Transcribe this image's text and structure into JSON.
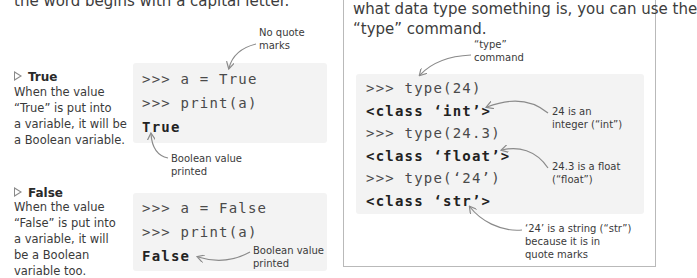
{
  "left": {
    "intro_partial": "the word begins with a capital letter.",
    "true_section": {
      "title": "True",
      "description": [
        "When the value",
        "“True” is put into",
        "a variable, it will be",
        "a Boolean variable."
      ],
      "code": [
        {
          "kind": "input",
          "text": ">>> a = True"
        },
        {
          "kind": "input",
          "text": ">>> print(a)"
        },
        {
          "kind": "output",
          "text": "True"
        }
      ],
      "note_top": [
        "No quote",
        "marks"
      ],
      "note_bottom": [
        "Boolean value",
        "printed"
      ]
    },
    "false_section": {
      "title": "False",
      "description": [
        "When the value",
        "“False” is put into",
        "a variable, it will",
        "be a Boolean",
        "variable too."
      ],
      "code": [
        {
          "kind": "input",
          "text": ">>> a = False"
        },
        {
          "kind": "input",
          "text": ">>> print(a)"
        },
        {
          "kind": "output",
          "text": "False"
        }
      ],
      "note": [
        "Boolean value",
        "printed"
      ]
    }
  },
  "right_box": {
    "intro": [
      "what data type something is, you can use the",
      "“type” command."
    ],
    "code": [
      {
        "kind": "input",
        "text": ">>> type(24)"
      },
      {
        "kind": "output",
        "text": "<class ‘int’>"
      },
      {
        "kind": "input",
        "text": ">>> type(24.3)"
      },
      {
        "kind": "output",
        "text": "<class ‘float’>"
      },
      {
        "kind": "input",
        "text": ">>> type(‘24’)"
      },
      {
        "kind": "output",
        "text": "<class ‘str’>"
      }
    ],
    "notes": {
      "type_command": [
        "“type”",
        "command"
      ],
      "int": [
        "24 is an",
        "integer (“int”)"
      ],
      "float": [
        "24.3 is a float",
        "(“float”)"
      ],
      "str": [
        "‘24’ is a string (“str”)",
        "because it is in",
        "quote marks"
      ]
    }
  },
  "colors": {
    "code_bg": "#f3f3f3",
    "box_border": "#b9b9b9",
    "arrow": "#8a8a8a",
    "triangle": "#8a8a8a"
  }
}
